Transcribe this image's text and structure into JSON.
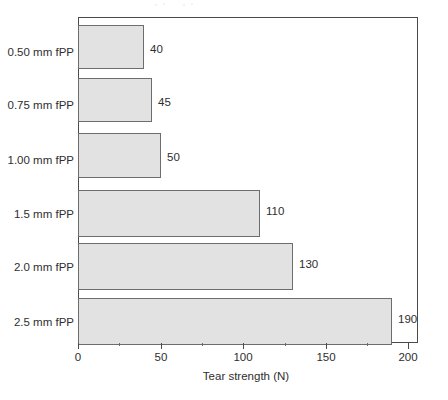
{
  "chart_data": {
    "type": "bar",
    "orientation": "horizontal",
    "title": "",
    "xlabel": "Tear strength (N)",
    "ylabel": "",
    "categories": [
      "0.50 mm fPP",
      "0.75 mm fPP",
      "1.00 mm fPP",
      "1.5 mm fPP",
      "2.0 mm fPP",
      "2.5 mm fPP"
    ],
    "values": [
      40,
      45,
      50,
      110,
      130,
      190
    ],
    "value_labels": [
      "40",
      "45",
      "50",
      "110",
      "130",
      "190"
    ],
    "xlim": [
      0,
      220
    ],
    "xticks": [
      0,
      50,
      100,
      150,
      200
    ],
    "xtick_labels": [
      "0",
      "50",
      "100",
      "150",
      "200"
    ],
    "xticks_minor": [
      25,
      75,
      125,
      175
    ],
    "grid": false,
    "legend": null,
    "bar_fill_color": "#e2e2e2",
    "bar_border_color": "#6d6d6d",
    "axis_color": "#4a4a4a",
    "text_color": "#2e2e2e",
    "background_color": "#ffffff"
  }
}
